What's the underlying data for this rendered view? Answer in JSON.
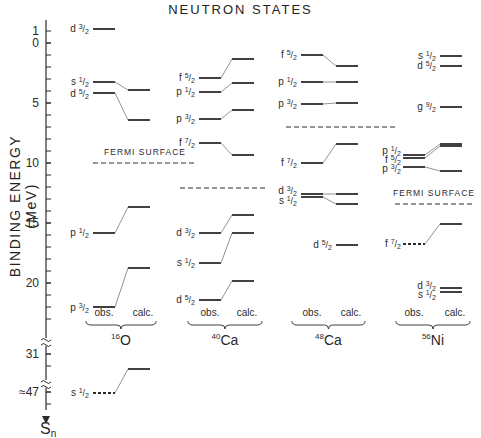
{
  "title": "NEUTRON STATES",
  "ylabel": "BINDING ENERGY (MeV)",
  "axis": {
    "ticks": [
      {
        "label": "1",
        "y": 31
      },
      {
        "label": "0",
        "y": 43
      },
      {
        "label": "5",
        "y": 103
      },
      {
        "label": "10",
        "y": 163
      },
      {
        "label": "15",
        "y": 223
      },
      {
        "label": "20",
        "y": 283
      },
      {
        "label": "31",
        "y": 354
      },
      {
        "label": "≈47",
        "y": 392
      }
    ],
    "bottom_label": "S",
    "bottom_sub": "n"
  },
  "fermi_label": "FERMI SURFACE",
  "obs_label": "obs.",
  "calc_label": "calc.",
  "nuclei": [
    {
      "mass": "16",
      "symbol": "O"
    },
    {
      "mass": "40",
      "symbol": "Ca"
    },
    {
      "mass": "48",
      "symbol": "Ca"
    },
    {
      "mass": "56",
      "symbol": "Ni"
    }
  ],
  "chart_data": {
    "type": "level-diagram",
    "title": "NEUTRON STATES",
    "xlabel": "",
    "ylabel": "BINDING ENERGY (MeV)",
    "ylim": [
      -1,
      47
    ],
    "y_axis_breaks": [
      [
        23,
        31
      ],
      [
        31,
        47
      ]
    ],
    "y_ticks": [
      1,
      0,
      5,
      10,
      15,
      20,
      31,
      47
    ],
    "categories": [
      "16O",
      "40Ca",
      "48Ca",
      "56Ni"
    ],
    "series": [
      {
        "name": "16O",
        "fermi_surface_MeV": 10.0,
        "levels": [
          {
            "state": "d3/2",
            "obs": -1.1,
            "calc": null
          },
          {
            "state": "s1/2",
            "obs": 3.3,
            "calc": 4.0
          },
          {
            "state": "d5/2",
            "obs": 4.2,
            "calc": 6.4
          },
          {
            "state": "p1/2",
            "obs": 15.7,
            "calc": 13.7
          },
          {
            "state": "p3/2",
            "obs": 21.8,
            "calc": 18.6
          },
          {
            "state": "s1/2",
            "obs": 47,
            "calc": 31,
            "obs_dashed": true
          }
        ]
      },
      {
        "name": "40Ca",
        "fermi_surface_MeV": 12.0,
        "levels": [
          {
            "state": "f5/2",
            "obs": 2.9,
            "calc": 1.3
          },
          {
            "state": "p1/2",
            "obs": 4.1,
            "calc": 3.3
          },
          {
            "state": "p3/2",
            "obs": 6.3,
            "calc": 5.6
          },
          {
            "state": "f7/2",
            "obs": 8.3,
            "calc": 9.3
          },
          {
            "state": "d3/2",
            "obs": 15.8,
            "calc": 14.3
          },
          {
            "state": "s1/2",
            "obs": 18.3,
            "calc": 15.8
          },
          {
            "state": "d5/2",
            "obs": 21.3,
            "calc": 19.8
          }
        ]
      },
      {
        "name": "48Ca",
        "fermi_surface_MeV": 7.0,
        "levels": [
          {
            "state": "f5/2",
            "obs": 1.0,
            "calc": 1.9
          },
          {
            "state": "p1/2",
            "obs": 3.3,
            "calc": 3.3
          },
          {
            "state": "p3/2",
            "obs": 5.1,
            "calc": 5.0
          },
          {
            "state": "f7/2",
            "obs": 10.0,
            "calc": 8.4
          },
          {
            "state": "d3/2",
            "obs": 12.6,
            "calc": 12.6
          },
          {
            "state": "s1/2",
            "obs": 12.8,
            "calc": 13.4
          },
          {
            "state": "d5/2",
            "obs": null,
            "calc": 16.8
          }
        ]
      },
      {
        "name": "56Ni",
        "fermi_surface_MeV": 13.4,
        "levels": [
          {
            "state": "s1/2",
            "obs": null,
            "calc": 1.1
          },
          {
            "state": "d5/2",
            "obs": null,
            "calc": 1.9
          },
          {
            "state": "g9/2",
            "obs": null,
            "calc": 5.3
          },
          {
            "state": "p1/2",
            "obs": 9.3,
            "calc": 8.4
          },
          {
            "state": "f5/2",
            "obs": 9.6,
            "calc": 8.6
          },
          {
            "state": "p3/2",
            "obs": 10.3,
            "calc": 10.7
          },
          {
            "state": "f7/2",
            "obs": 16.8,
            "calc": 15.1,
            "obs_dashed": true
          },
          {
            "state": "d3/2",
            "obs": null,
            "calc": 20.4
          },
          {
            "state": "s1/2",
            "obs": null,
            "calc": 20.7
          }
        ]
      }
    ]
  },
  "render": {
    "columns": [
      {
        "obs_x": [
          93,
          115
        ],
        "calc_x": [
          128,
          150
        ],
        "fermi": {
          "y": 163,
          "x1": 93,
          "x2": 196,
          "label_x": 145,
          "label_y": 155
        },
        "brace": {
          "x1": 86,
          "x2": 156,
          "y": 325
        },
        "levels": [
          {
            "label": "d",
            "num": "3",
            "obs_y": 29,
            "calc_y": null,
            "lx": 89,
            "ly": 29
          },
          {
            "label": "s",
            "num": "1",
            "obs_y": 82,
            "calc_y": 90,
            "lx": 89,
            "ly": 82
          },
          {
            "label": "d",
            "num": "5",
            "obs_y": 93,
            "calc_y": 120,
            "lx": 89,
            "ly": 94
          },
          {
            "label": "p",
            "num": "1",
            "obs_y": 233,
            "calc_y": 207,
            "lx": 89,
            "ly": 233
          },
          {
            "label": "p",
            "num": "3",
            "obs_y": 307,
            "calc_y": 268,
            "lx": 89,
            "ly": 308
          },
          {
            "label": "s",
            "num": "1",
            "obs_y": 393,
            "calc_y": 369,
            "lx": 89,
            "ly": 393,
            "dashed": true
          }
        ]
      },
      {
        "obs_x": [
          199,
          221
        ],
        "calc_x": [
          232,
          254
        ],
        "fermi": {
          "y": 188,
          "x1": 180,
          "x2": 268
        },
        "brace": {
          "x1": 188,
          "x2": 262,
          "y": 325
        },
        "levels": [
          {
            "label": "f",
            "num": "5",
            "obs_y": 78,
            "calc_y": 59,
            "lx": 195,
            "ly": 78
          },
          {
            "label": "p",
            "num": "1",
            "obs_y": 92,
            "calc_y": 83,
            "lx": 195,
            "ly": 92
          },
          {
            "label": "p",
            "num": "3",
            "obs_y": 119,
            "calc_y": 110,
            "lx": 195,
            "ly": 119
          },
          {
            "label": "f",
            "num": "7",
            "obs_y": 143,
            "calc_y": 155,
            "lx": 195,
            "ly": 143
          },
          {
            "label": "d",
            "num": "3",
            "obs_y": 233,
            "calc_y": 215,
            "lx": 195,
            "ly": 233
          },
          {
            "label": "s",
            "num": "1",
            "obs_y": 263,
            "calc_y": 233,
            "lx": 195,
            "ly": 263
          },
          {
            "label": "d",
            "num": "5",
            "obs_y": 300,
            "calc_y": 281,
            "lx": 195,
            "ly": 300
          }
        ]
      },
      {
        "obs_x": [
          301,
          323
        ],
        "calc_x": [
          336,
          358
        ],
        "fermi": {
          "y": 127,
          "x1": 286,
          "x2": 398
        },
        "brace": {
          "x1": 292,
          "x2": 365,
          "y": 325
        },
        "levels": [
          {
            "label": "f",
            "num": "5",
            "obs_y": 55,
            "calc_y": 66,
            "lx": 297,
            "ly": 55
          },
          {
            "label": "p",
            "num": "1",
            "obs_y": 82,
            "calc_y": 82,
            "lx": 297,
            "ly": 82
          },
          {
            "label": "p",
            "num": "3",
            "obs_y": 104,
            "calc_y": 103,
            "lx": 297,
            "ly": 104
          },
          {
            "label": "f",
            "num": "7",
            "obs_y": 163,
            "calc_y": 144,
            "lx": 297,
            "ly": 163
          },
          {
            "label": "d",
            "num": "3",
            "obs_y": 194,
            "calc_y": 194,
            "lx": 297,
            "ly": 191
          },
          {
            "label": "s",
            "num": "1",
            "obs_y": 197,
            "calc_y": 204,
            "lx": 297,
            "ly": 201
          },
          {
            "label": "d",
            "num": "5",
            "obs_y": null,
            "calc_y": 245,
            "lx": 332,
            "ly": 245
          }
        ]
      },
      {
        "obs_x": [
          403,
          425
        ],
        "calc_x": [
          440,
          462
        ],
        "fermi": {
          "y": 204,
          "x1": 395,
          "x2": 475,
          "label_x": 434,
          "label_y": 196
        },
        "brace": {
          "x1": 396,
          "x2": 470,
          "y": 325
        },
        "levels": [
          {
            "label": "s",
            "num": "1",
            "obs_y": null,
            "calc_y": 56,
            "lx": 436,
            "ly": 56
          },
          {
            "label": "d",
            "num": "5",
            "obs_y": null,
            "calc_y": 66,
            "lx": 436,
            "ly": 66
          },
          {
            "label": "g",
            "num": "9",
            "obs_y": null,
            "calc_y": 107,
            "lx": 436,
            "ly": 107
          },
          {
            "label": "p",
            "num": "1",
            "obs_y": 155,
            "calc_y": 144,
            "lx": 401,
            "ly": 151
          },
          {
            "label": "f",
            "num": "5",
            "obs_y": 158,
            "calc_y": 146,
            "lx": 401,
            "ly": 160
          },
          {
            "label": "p",
            "num": "3",
            "obs_y": 167,
            "calc_y": 171,
            "lx": 401,
            "ly": 169
          },
          {
            "label": "f",
            "num": "7",
            "obs_y": 244,
            "calc_y": 224,
            "lx": 401,
            "ly": 244,
            "dashed": true
          },
          {
            "label": "d",
            "num": "3",
            "obs_y": null,
            "calc_y": 288,
            "lx": 436,
            "ly": 286
          },
          {
            "label": "s",
            "num": "1",
            "obs_y": null,
            "calc_y": 292,
            "lx": 436,
            "ly": 295
          }
        ]
      }
    ]
  }
}
